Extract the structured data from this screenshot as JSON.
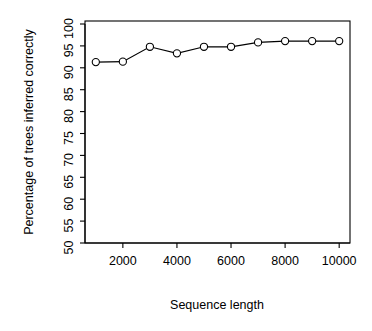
{
  "chart_data": {
    "type": "line",
    "title": "",
    "xlabel": "Sequence length",
    "ylabel": "Percentage of trees inferred correctly",
    "x": [
      1000,
      2000,
      3000,
      4000,
      5000,
      6000,
      7000,
      8000,
      9000,
      10000
    ],
    "values": [
      91.3,
      91.4,
      94.8,
      93.3,
      94.8,
      94.8,
      95.8,
      96.1,
      96.1,
      96.1
    ],
    "series": [
      {
        "name": "Percentage of trees inferred correctly",
        "values": [
          91.3,
          91.4,
          94.8,
          93.3,
          94.8,
          94.8,
          95.8,
          96.1,
          96.1,
          96.1
        ]
      }
    ],
    "xlim": [
      600,
      10400
    ],
    "ylim": [
      50,
      100
    ],
    "xticks": [
      2000,
      4000,
      6000,
      8000,
      10000
    ],
    "xtick_labels": [
      "2000",
      "4000",
      "6000",
      "8000",
      "10000"
    ],
    "yticks": [
      50,
      55,
      60,
      65,
      70,
      75,
      80,
      85,
      90,
      95,
      100
    ],
    "ytick_labels": [
      "50",
      "55",
      "60",
      "65",
      "70",
      "75",
      "80",
      "85",
      "90",
      "95",
      "100"
    ],
    "grid": false,
    "legend": false,
    "marker": "open-circle",
    "line_color": "#000000",
    "marker_color": "#000000",
    "background_color": "#ffffff",
    "box_border": true
  },
  "axes": {
    "x_axis_title": "Sequence length",
    "y_axis_title": "Percentage of trees inferred correctly"
  }
}
